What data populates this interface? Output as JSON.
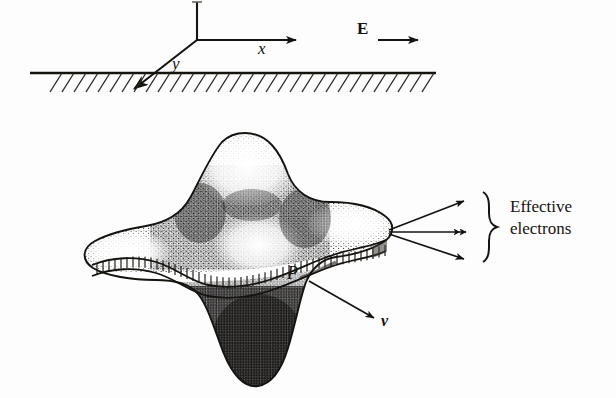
{
  "figure": {
    "kind": "physics-diagram",
    "background_color": "#fdfdfd",
    "ink_color": "#15130f",
    "top_panel": {
      "axes": {
        "x_label": "x",
        "y_label": "y",
        "z_label": "",
        "origin_px": [
          197,
          40
        ]
      },
      "field": {
        "label": "E",
        "style": "bold-upright-vector",
        "arrow_direction": "right"
      },
      "ground": {
        "name": "hatched-ground-plane",
        "hatch_direction": "down-left",
        "hatch_count": 34
      }
    },
    "bottom_panel": {
      "surface": {
        "name": "four-lobed-wavefront",
        "lobes": 4,
        "shading": "stipple"
      },
      "band": {
        "name": "ribbon-band",
        "tick_count": 54
      },
      "point_label": "P",
      "velocity_label": "v",
      "velocity_style": "bold-italic-vector",
      "emission": {
        "arrow_count": 3,
        "brace": "right-curly-brace",
        "label_line1": "Effective",
        "label_line2": "electrons"
      }
    }
  }
}
